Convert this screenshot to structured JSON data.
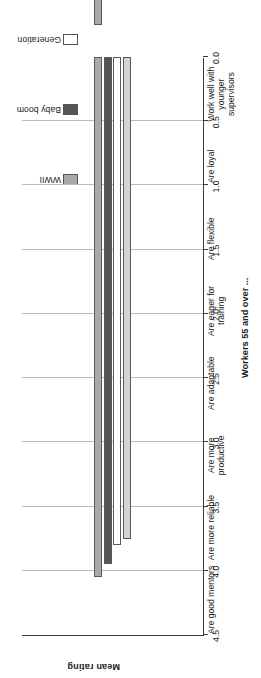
{
  "chart_data": {
    "type": "bar",
    "orientation": "horizontal",
    "title": "",
    "xlabel": "Workers 55 and over ...",
    "ylabel": "Mean rating",
    "ylim": [
      0.0,
      4.5
    ],
    "grid": true,
    "legend_position": "top-right",
    "tick_labels": [
      "4.5",
      "4.0",
      "3.5",
      "3.0",
      "2.5",
      "2.0",
      "1.5",
      "1.0",
      "0.5",
      "0.0"
    ],
    "tick_values": [
      4.5,
      4.0,
      3.5,
      3.0,
      2.5,
      2.0,
      1.5,
      1.0,
      0.5,
      0.0
    ],
    "categories": [
      "Are good mentors",
      "Are more reliable",
      "Are more productive",
      "Are adaptable",
      "Are eager for training",
      "Are flexible",
      "Are loyal",
      "Work well with younger supervisors"
    ],
    "series": [
      {
        "name": "WWII",
        "color": "#a9a9a9",
        "values": [
          4.05,
          4.25,
          3.95,
          3.8,
          3.6,
          4.25,
          4.3,
          3.85
        ]
      },
      {
        "name": "Baby boom",
        "color": "#555555",
        "values": [
          3.95,
          4.05,
          3.8,
          3.65,
          3.45,
          4.05,
          4.1,
          3.75
        ]
      },
      {
        "name": "Generation",
        "color": "#ffffff",
        "values": [
          3.8,
          3.8,
          3.55,
          3.35,
          3.25,
          3.8,
          3.85,
          3.55
        ]
      },
      {
        "name": "Generation",
        "color": "#d3d3d3",
        "values": [
          3.75,
          3.7,
          3.45,
          3.3,
          3.15,
          3.7,
          3.75,
          3.5
        ]
      }
    ]
  },
  "legend": {
    "items": [
      {
        "label": "WWII",
        "color": "#a9a9a9"
      },
      {
        "label": "Baby boom",
        "color": "#555555"
      },
      {
        "label": "Generation",
        "color": "#ffffff"
      },
      {
        "label": "Generation",
        "color": "#d3d3d3"
      }
    ]
  },
  "axes": {
    "value_axis_title": "Mean rating",
    "category_axis_title": "Workers 55 and over ..."
  }
}
